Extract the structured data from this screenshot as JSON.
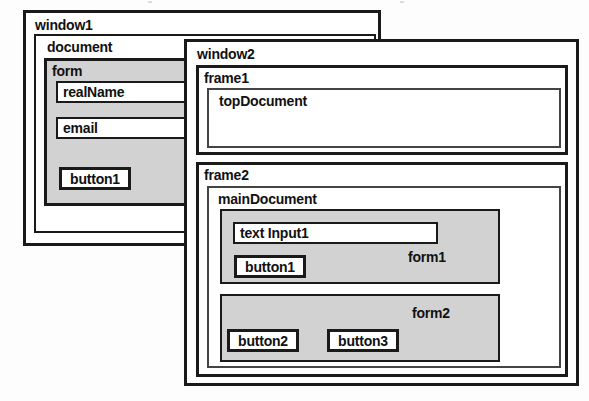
{
  "diagram": {
    "colors": {
      "outline": "#1a1a1a",
      "inner_outline": "#444444",
      "form_fill": "#d2d2d2",
      "page_background": "#fdfdfd",
      "box_background": "#ffffff"
    },
    "window1": {
      "label": "window1",
      "document": {
        "label": "document",
        "form": {
          "label": "form",
          "fields": [
            {
              "label": "realName"
            },
            {
              "label": "email"
            }
          ],
          "buttons": [
            {
              "label": "button1"
            }
          ]
        }
      }
    },
    "window2": {
      "label": "window2",
      "frame1": {
        "label": "frame1",
        "document": {
          "label": "topDocument"
        }
      },
      "frame2": {
        "label": "frame2",
        "document": {
          "label": "mainDocument",
          "form1": {
            "label": "form1",
            "fields": [
              {
                "label": "text Input1"
              }
            ],
            "buttons": [
              {
                "label": "button1"
              }
            ]
          },
          "form2": {
            "label": "form2",
            "fields": [],
            "buttons": [
              {
                "label": "button2"
              },
              {
                "label": "button3"
              }
            ]
          }
        }
      }
    }
  }
}
